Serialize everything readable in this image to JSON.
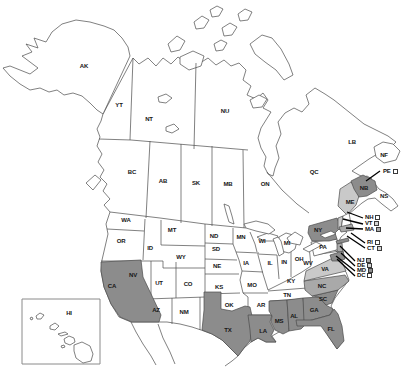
{
  "map": {
    "description": "Outline map of the United States and Canada with selected states and provinces shaded",
    "colors": {
      "background": "#ffffff",
      "outline": "#4a4a4a",
      "label_text": "#161616",
      "callout_line": "#000000",
      "inset_border": "#8a8a8a",
      "shade_dark": "#8c8c8c",
      "shade_medium": "#a9a9a9",
      "shade_light": "#c9c9c9",
      "square_white": "#ffffff",
      "square_light": "#d6d6d6",
      "square_gray": "#ababab",
      "square_dark": "#8c8c8c"
    },
    "region_shading": {
      "CA": "dark",
      "TX": "dark",
      "LA": "dark",
      "MS": "dark",
      "AL": "dark",
      "GA": "dark",
      "FL": "dark",
      "SC": "dark",
      "NC": "medium",
      "VA": "light",
      "NY": "dark",
      "NY-LI": "dark",
      "MA": "medium",
      "NJ": "medium",
      "MD": "dark",
      "VT": "light",
      "ME": "light",
      "NB": "dark"
    },
    "labels": [
      {
        "code": "AK",
        "x": 84,
        "y": 66
      },
      {
        "code": "YT",
        "x": 119,
        "y": 105
      },
      {
        "code": "NT",
        "x": 149,
        "y": 119
      },
      {
        "code": "NU",
        "x": 225,
        "y": 111
      },
      {
        "code": "BC",
        "x": 132,
        "y": 172
      },
      {
        "code": "AB",
        "x": 163,
        "y": 181
      },
      {
        "code": "SK",
        "x": 196,
        "y": 183
      },
      {
        "code": "MB",
        "x": 228,
        "y": 184
      },
      {
        "code": "ON",
        "x": 265,
        "y": 184
      },
      {
        "code": "QC",
        "x": 314,
        "y": 172
      },
      {
        "code": "LB",
        "x": 352,
        "y": 142
      },
      {
        "code": "NF",
        "x": 384,
        "y": 155
      },
      {
        "code": "NS",
        "x": 384,
        "y": 196
      },
      {
        "code": "NB",
        "x": 364,
        "y": 188
      },
      {
        "code": "ME",
        "x": 350,
        "y": 202
      },
      {
        "code": "WA",
        "x": 126,
        "y": 220
      },
      {
        "code": "OR",
        "x": 121,
        "y": 241
      },
      {
        "code": "CA",
        "x": 112,
        "y": 286
      },
      {
        "code": "NV",
        "x": 133,
        "y": 275
      },
      {
        "code": "ID",
        "x": 150,
        "y": 248
      },
      {
        "code": "MT",
        "x": 172,
        "y": 230
      },
      {
        "code": "WY",
        "x": 181,
        "y": 257
      },
      {
        "code": "UT",
        "x": 159,
        "y": 283
      },
      {
        "code": "CO",
        "x": 188,
        "y": 284
      },
      {
        "code": "AZ",
        "x": 156,
        "y": 310
      },
      {
        "code": "NM",
        "x": 184,
        "y": 312
      },
      {
        "code": "ND",
        "x": 214,
        "y": 236
      },
      {
        "code": "SD",
        "x": 216,
        "y": 249
      },
      {
        "code": "NE",
        "x": 217,
        "y": 266
      },
      {
        "code": "KS",
        "x": 219,
        "y": 287
      },
      {
        "code": "OK",
        "x": 229,
        "y": 305
      },
      {
        "code": "TX",
        "x": 228,
        "y": 330
      },
      {
        "code": "MN",
        "x": 241,
        "y": 237
      },
      {
        "code": "IA",
        "x": 246,
        "y": 263
      },
      {
        "code": "MO",
        "x": 252,
        "y": 285
      },
      {
        "code": "AR",
        "x": 261,
        "y": 305
      },
      {
        "code": "LA",
        "x": 263,
        "y": 331
      },
      {
        "code": "WI",
        "x": 262,
        "y": 241
      },
      {
        "code": "IL",
        "x": 270,
        "y": 263
      },
      {
        "code": "MI",
        "x": 287,
        "y": 243
      },
      {
        "code": "IN",
        "x": 284,
        "y": 262
      },
      {
        "code": "OH",
        "x": 299,
        "y": 259
      },
      {
        "code": "KY",
        "x": 291,
        "y": 281
      },
      {
        "code": "TN",
        "x": 287,
        "y": 295
      },
      {
        "code": "MS",
        "x": 279,
        "y": 321
      },
      {
        "code": "AL",
        "x": 294,
        "y": 316
      },
      {
        "code": "GA",
        "x": 314,
        "y": 310
      },
      {
        "code": "SC",
        "x": 323,
        "y": 299
      },
      {
        "code": "NC",
        "x": 322,
        "y": 286
      },
      {
        "code": "FL",
        "x": 331,
        "y": 329
      },
      {
        "code": "WV",
        "x": 308,
        "y": 263
      },
      {
        "code": "VA",
        "x": 325,
        "y": 269
      },
      {
        "code": "PA",
        "x": 323,
        "y": 247
      },
      {
        "code": "NY",
        "x": 318,
        "y": 230
      },
      {
        "code": "HI",
        "x": 69,
        "y": 313
      }
    ],
    "callouts": [
      {
        "code": "PE",
        "x": 383,
        "y": 171,
        "square": "white",
        "line": [
          380,
          171,
          366,
          181
        ]
      },
      {
        "code": "NH",
        "x": 365,
        "y": 217,
        "square": "white",
        "line": [
          363,
          218,
          347,
          212
        ]
      },
      {
        "code": "VT",
        "x": 365,
        "y": 223,
        "square": "light",
        "line": [
          363,
          224,
          343,
          219
        ]
      },
      {
        "code": "MA",
        "x": 365,
        "y": 229,
        "square": "gray",
        "line": [
          363,
          229,
          346,
          228
        ]
      },
      {
        "code": "RI",
        "x": 367,
        "y": 242,
        "square": "white",
        "line": [
          365,
          243,
          351,
          233
        ]
      },
      {
        "code": "CT",
        "x": 367,
        "y": 248,
        "square": "light",
        "line": [
          365,
          248,
          347,
          236
        ]
      },
      {
        "code": "NJ",
        "x": 357,
        "y": 260,
        "square": "gray",
        "line": [
          355,
          261,
          340,
          246
        ]
      },
      {
        "code": "DE",
        "x": 357,
        "y": 265,
        "square": "light",
        "line": [
          355,
          266,
          341,
          253
        ]
      },
      {
        "code": "MD",
        "x": 357,
        "y": 270,
        "square": "dark",
        "line": [
          355,
          271,
          336,
          256
        ]
      },
      {
        "code": "DC",
        "x": 357,
        "y": 275,
        "square": "white",
        "line": [
          355,
          276,
          337,
          259
        ]
      }
    ]
  }
}
